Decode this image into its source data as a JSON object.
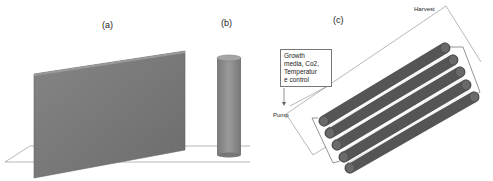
{
  "panels": {
    "a": {
      "label": "(a)",
      "description": "flat panel photobioreactor"
    },
    "b": {
      "label": "(b)",
      "description": "tubular column photobioreactor"
    },
    "c": {
      "label": "(c)",
      "description": "horizontal tubular photobioreactor array"
    }
  },
  "annotations": {
    "harvest": "Harvest",
    "pump": "Pump",
    "growth_box_lines": [
      "Growth",
      "media, Co2,",
      "Temperatur",
      "e control"
    ]
  },
  "colors": {
    "panel_fill": "#7a7a7a",
    "column_fill": "#8a8a8a",
    "tube_fill": "#5e5e5e",
    "line": "#888888"
  },
  "tube_count": 5
}
